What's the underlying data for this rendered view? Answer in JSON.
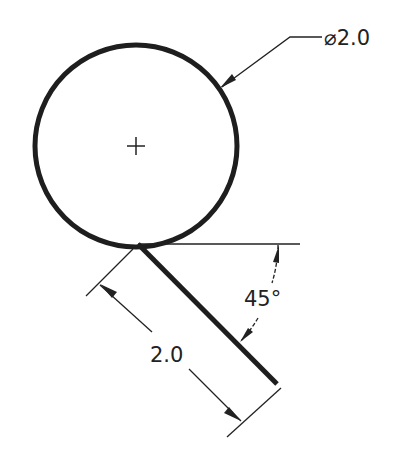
{
  "drawing": {
    "type": "cad-dimension-drawing",
    "colors": {
      "stroke": "#1e1e1e",
      "background": "#ffffff"
    },
    "circle": {
      "label": "circle",
      "diameter_label": "⌀2.0",
      "center_mark": "+"
    },
    "line": {
      "label": "tangent line",
      "length_label": "2.0",
      "angle_label": "45°"
    },
    "dimensions": [
      {
        "name": "diameter",
        "text": "⌀2.0"
      },
      {
        "name": "angle",
        "text": "45°"
      },
      {
        "name": "length",
        "text": "2.0"
      }
    ]
  }
}
